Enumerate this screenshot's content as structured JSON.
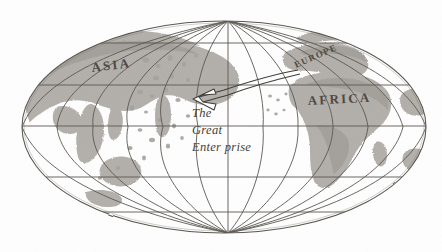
{
  "figure": {
    "kind": "hand-drawn world map",
    "projection": "elliptical (Mollweide-style) globe graticule",
    "background_color": "#ffffff",
    "line_color": "#4a463f",
    "land_color": "#a9a5a0",
    "land_color_dark": "#8e8a85",
    "text_color": "#2e2b26",
    "width": 442,
    "height": 252
  },
  "labels": {
    "asia": "ASIA",
    "europe": "EUROPE",
    "africa": "AFRICA"
  },
  "annotation": {
    "line1": "The",
    "line2": "Great",
    "line3": "Enter prise",
    "full_text": "The Great Enterprise",
    "arrow": {
      "name": "curved-arrow",
      "description": "hollow outlined arrow curving from Europe westward, head pointing left",
      "direction": "right-to-left"
    }
  },
  "graticule": {
    "meridian_x_at_equator": [
      22,
      57,
      93,
      128,
      163,
      198,
      228,
      263,
      298,
      333,
      368,
      403,
      425
    ],
    "parallel_y": [
      43,
      85,
      126,
      177,
      212
    ],
    "equator_y": 126,
    "pole_top": {
      "x": 228,
      "y": 22
    },
    "pole_bottom": {
      "x": 228,
      "y": 233
    },
    "ellipse_left_x": 22,
    "ellipse_right_x": 426
  }
}
